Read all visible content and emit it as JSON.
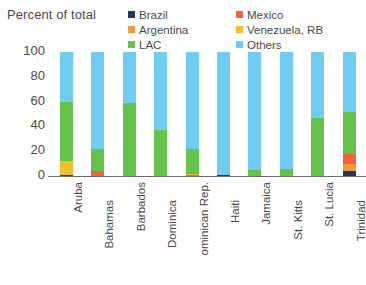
{
  "axis_title": "Percent of total",
  "legend": {
    "column1": [
      {
        "label": "Brazil",
        "color": "#1f3864"
      },
      {
        "label": "Argentina",
        "color": "#ee9b3a"
      },
      {
        "label": "LAC",
        "color": "#63c34a"
      }
    ],
    "column2": [
      {
        "label": "Mexico",
        "color": "#f4623a"
      },
      {
        "label": "Venezuela, RB",
        "color": "#f2c02e"
      },
      {
        "label": "Others",
        "color": "#6fcdf2"
      }
    ]
  },
  "chart_data": {
    "type": "bar",
    "stacked": true,
    "title": "",
    "xlabel": "",
    "ylabel": "Percent of total",
    "ylim": [
      0,
      100
    ],
    "yticks": [
      0,
      20,
      40,
      60,
      80,
      100
    ],
    "ytick_labels": [
      "0",
      "20",
      "40",
      "60",
      "80",
      "100"
    ],
    "grid": false,
    "legend_position": "top",
    "categories": [
      "Aruba",
      "Bahamas",
      "Barbados",
      "Dominica",
      "ominican Rep.",
      "Haiti",
      "Jamaica",
      "St. Kitts",
      "St. Lucia",
      "Trinidad"
    ],
    "series": [
      {
        "name": "Brazil",
        "color": "#1f3864",
        "values": [
          1,
          0,
          0,
          0,
          0,
          1,
          0,
          0,
          0,
          4
        ]
      },
      {
        "name": "Argentina",
        "color": "#ee9b3a",
        "values": [
          0,
          0,
          0,
          0,
          0,
          0,
          0,
          0,
          0,
          6
        ]
      },
      {
        "name": "Mexico",
        "color": "#f4623a",
        "values": [
          0,
          4,
          0,
          0,
          1,
          0,
          0,
          0,
          0,
          8
        ]
      },
      {
        "name": "Venezuela, RB",
        "color": "#f2c02e",
        "values": [
          11,
          0,
          0,
          0,
          1,
          0,
          0,
          0,
          0,
          0
        ]
      },
      {
        "name": "LAC",
        "color": "#63c34a",
        "values": [
          48,
          18,
          59,
          37,
          20,
          0,
          5,
          6,
          47,
          34
        ]
      },
      {
        "name": "Others",
        "color": "#6fcdf2",
        "values": [
          40,
          78,
          41,
          63,
          78,
          99,
          95,
          94,
          53,
          48
        ]
      }
    ]
  }
}
